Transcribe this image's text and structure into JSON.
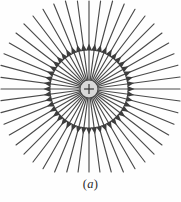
{
  "figure": {
    "caption": "(a)",
    "caption_open_paren": "(",
    "caption_letter": "a",
    "caption_close_paren": ")",
    "background_color": "#fefefe"
  },
  "charge": {
    "sign_label": "+",
    "polarity": "positive",
    "center_x": 89,
    "center_y": 89,
    "radius": 9,
    "fill_color": "#d9d9d9",
    "edge_color": "#4a4a4a",
    "sign_color": "#3a3a3a"
  },
  "field": {
    "line_count": 48,
    "line_color": "#4a4a4a",
    "line_width": 1.15,
    "inner_radius": 9,
    "outer_radius": 92,
    "arrow_radius": 42,
    "arrow_length": 7,
    "arrow_half_width": 3,
    "arrow_color": "#3d3d3d",
    "direction": "outward",
    "angles_deg": [
      0,
      7.5,
      15,
      22.5,
      30,
      37.5,
      45,
      52.5,
      60,
      67.5,
      75,
      82.5,
      90,
      97.5,
      105,
      112.5,
      120,
      127.5,
      135,
      142.5,
      150,
      157.5,
      165,
      172.5,
      180,
      187.5,
      195,
      202.5,
      210,
      217.5,
      225,
      232.5,
      240,
      247.5,
      255,
      262.5,
      270,
      277.5,
      285,
      292.5,
      300,
      307.5,
      315,
      322.5,
      330,
      337.5,
      345,
      352.5
    ]
  }
}
